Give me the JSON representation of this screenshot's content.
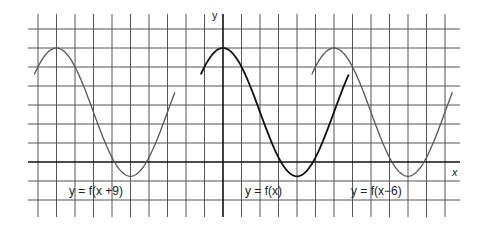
{
  "chart_data": {
    "type": "line",
    "title": "",
    "xlabel": "x",
    "ylabel": "y",
    "grid": true,
    "series": [
      {
        "name": "y = f(x+9)",
        "peak_x": -9,
        "trough_x": -5,
        "x_range": [
          -10.2,
          -2.6
        ],
        "color": "#555555"
      },
      {
        "name": "y = f(x)",
        "peak_x": 0,
        "trough_x": 4,
        "x_range": [
          -1.2,
          6.8
        ],
        "color": "#111111"
      },
      {
        "name": "y = f(x-6)",
        "peak_x": 6,
        "trough_x": 10,
        "x_range": [
          4.8,
          12.4
        ],
        "color": "#555555"
      }
    ],
    "period_units": 8,
    "peak_y_units": 6,
    "trough_y_units": -0.75
  },
  "labels": {
    "y_axis": "y",
    "x_axis": "x",
    "curve_left": "y = f(x +9)",
    "curve_middle": "y = f(x)",
    "curve_right": "y = f(x−6)"
  },
  "colors": {
    "grid": "#444444",
    "axis": "#111111",
    "curve_main": "#111111",
    "curve_shifted": "#555555"
  }
}
